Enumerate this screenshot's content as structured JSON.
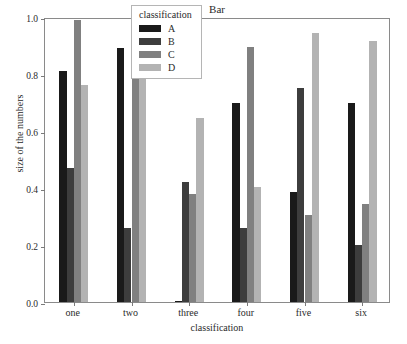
{
  "chart_data": {
    "type": "bar",
    "title": "Bar",
    "xlabel": "classification",
    "ylabel": "size of the numbers",
    "categories": [
      "one",
      "two",
      "three",
      "four",
      "five",
      "six"
    ],
    "ylim": [
      0.0,
      1.0
    ],
    "yticks": [
      "0.0",
      "0.2",
      "0.4",
      "0.6",
      "0.8",
      "1.0"
    ],
    "ytick_values": [
      0.0,
      0.2,
      0.4,
      0.6,
      0.8,
      1.0
    ],
    "grid": false,
    "legend_title": "classification",
    "legend_position": "upper center",
    "series": [
      {
        "name": "A",
        "color": "#1a1a1a",
        "values": [
          0.81,
          0.89,
          0.005,
          0.7,
          0.385,
          0.7
        ]
      },
      {
        "name": "B",
        "color": "#3d3d3d",
        "values": [
          0.47,
          0.26,
          0.42,
          0.26,
          0.75,
          0.2
        ]
      },
      {
        "name": "C",
        "color": "#808080",
        "values": [
          0.99,
          0.945,
          0.38,
          0.895,
          0.305,
          0.345
        ]
      },
      {
        "name": "D",
        "color": "#b3b3b3",
        "values": [
          0.76,
          1.0,
          0.645,
          0.405,
          0.945,
          0.915
        ]
      }
    ]
  }
}
